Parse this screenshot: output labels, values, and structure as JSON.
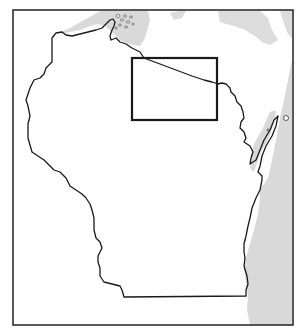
{
  "map": {
    "subject": "Wisconsin state outline",
    "frame": {
      "x": 13,
      "y": 10,
      "width": 280,
      "height": 315
    },
    "colors": {
      "background": "#ffffff",
      "water": "#d9d9d9",
      "outline": "#1a1a1a",
      "frame": "#222222",
      "highlight_box": "#1a1a1a"
    },
    "highlight_box": {
      "x": 132,
      "y": 58,
      "width": 85,
      "height": 62
    },
    "layers": [
      {
        "name": "lake-superior",
        "type": "water"
      },
      {
        "name": "lake-michigan",
        "type": "water"
      },
      {
        "name": "upper-peninsula-water",
        "type": "water"
      },
      {
        "name": "state-outline",
        "type": "boundary"
      },
      {
        "name": "apostle-islands",
        "type": "islands"
      },
      {
        "name": "door-peninsula",
        "type": "peninsula"
      },
      {
        "name": "highlight-box",
        "type": "inset-marker"
      }
    ]
  }
}
